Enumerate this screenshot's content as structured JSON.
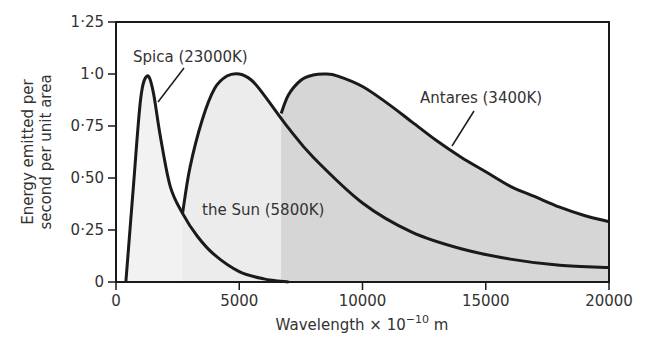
{
  "chart_data": {
    "type": "line",
    "title": "",
    "xlabel": "Wavelength × 10⁻¹⁰ m",
    "xlabel_base": "Wavelength × 10",
    "xlabel_exp": "−10",
    "xlabel_unit": " m",
    "ylabel_lines": [
      "Energy emitted per",
      "second per unit area"
    ],
    "xlim": [
      0,
      20000
    ],
    "ylim": [
      0,
      1.25
    ],
    "xticks": [
      0,
      5000,
      10000,
      15000,
      20000
    ],
    "xtick_labels": [
      "0",
      "5000",
      "10000",
      "15000",
      "20000"
    ],
    "yticks": [
      0,
      0.25,
      0.5,
      0.75,
      1.0,
      1.25
    ],
    "ytick_labels": [
      "0",
      "0·25",
      "0·50",
      "0·75",
      "1·0",
      "1·25"
    ],
    "grid": false,
    "series": [
      {
        "name": "Spica (23000K)",
        "fill": "#f2f2f2",
        "x": [
          400,
          700,
          1000,
          1260,
          1500,
          1800,
          2200,
          2700,
          3300,
          4000,
          5000,
          6000,
          7000
        ],
        "y": [
          0.0,
          0.45,
          0.88,
          0.99,
          0.92,
          0.7,
          0.46,
          0.33,
          0.22,
          0.13,
          0.05,
          0.015,
          0.0
        ]
      },
      {
        "name": "the Sun (5800K)",
        "fill": "#ececec",
        "x": [
          2700,
          3000,
          3500,
          4000,
          4500,
          5000,
          5500,
          6000,
          7000,
          8000,
          10000,
          12000,
          14000,
          16000,
          18000,
          20000
        ],
        "y": [
          0.33,
          0.55,
          0.78,
          0.93,
          0.99,
          1.0,
          0.97,
          0.9,
          0.74,
          0.6,
          0.38,
          0.24,
          0.16,
          0.11,
          0.08,
          0.07
        ]
      },
      {
        "name": "Antares (3400K)",
        "fill": "#d6d6d6",
        "x": [
          6700,
          7000,
          7500,
          8000,
          8500,
          9000,
          10000,
          11000,
          12000,
          13000,
          14000,
          15000,
          16000,
          17000,
          18000,
          19000,
          20000
        ],
        "y": [
          0.81,
          0.9,
          0.97,
          0.995,
          1.0,
          0.99,
          0.94,
          0.86,
          0.77,
          0.68,
          0.6,
          0.53,
          0.46,
          0.41,
          0.36,
          0.32,
          0.29
        ]
      }
    ],
    "annotations": [
      {
        "text": "Spica (23000K)",
        "x": 1800,
        "y": 1.06
      },
      {
        "text": "the Sun (5800K)",
        "x": 3600,
        "y": 0.32
      },
      {
        "text": "Antares (3400K)",
        "x": 12400,
        "y": 0.82
      }
    ]
  }
}
